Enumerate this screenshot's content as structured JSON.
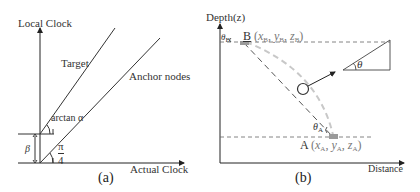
{
  "panel_a": {
    "caption": "(a)",
    "y_axis_label": "Local Clock",
    "x_axis_label": "Actual Clock",
    "lines": [
      {
        "name": "Target",
        "label": "Target"
      },
      {
        "name": "Anchor nodes",
        "label": "Anchor nodes"
      }
    ],
    "angle_target_label": "arctan α",
    "angle_anchor_label_num": "π",
    "angle_anchor_label_den": "4",
    "offset_label": "β"
  },
  "panel_b": {
    "caption": "(b)",
    "y_axis_label": "Depth(z)",
    "x_axis_label": "Distance",
    "point_b": {
      "name": "B",
      "coords_label": "(x",
      "sub": "B"
    },
    "point_a": {
      "name": "A",
      "coords_label": "(x",
      "sub": "A"
    },
    "theta_b_label": "θ",
    "theta_b_sub": "B",
    "theta_a_label": "θ",
    "theta_a_sub": "A",
    "slope_angle_label": "θ",
    "colors": {
      "axis": "#222222",
      "dashed_line": "#555555",
      "curved_path": "#c8c8c8",
      "point_marker": "#9a9a9a"
    }
  }
}
